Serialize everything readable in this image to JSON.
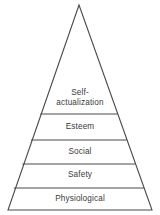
{
  "figure": {
    "name": "maslow-hierarchy-of-needs-pyramid",
    "shape": "pyramid",
    "background_color": "#ffffff",
    "line_color": "#4a4a4a",
    "text_color": "#3b3b3b",
    "apex": {
      "x": 79,
      "y": 5
    },
    "base_left": {
      "x": 8,
      "y": 210
    },
    "base_right": {
      "x": 152,
      "y": 210
    },
    "divider_y": [
      114,
      140,
      164,
      188
    ]
  },
  "tiers": [
    {
      "id": "self-actualization",
      "label": "Self-\nactualization",
      "label_plain": "Self-actualization",
      "level": 5,
      "position": "top"
    },
    {
      "id": "esteem",
      "label": "Esteem",
      "label_plain": "Esteem",
      "level": 4,
      "position": "fourth"
    },
    {
      "id": "social",
      "label": "Social",
      "label_plain": "Social",
      "level": 3,
      "position": "middle"
    },
    {
      "id": "safety",
      "label": "Safety",
      "label_plain": "Safety",
      "level": 2,
      "position": "second"
    },
    {
      "id": "physiological",
      "label": "Physiological",
      "label_plain": "Physiological",
      "level": 1,
      "position": "base"
    }
  ]
}
